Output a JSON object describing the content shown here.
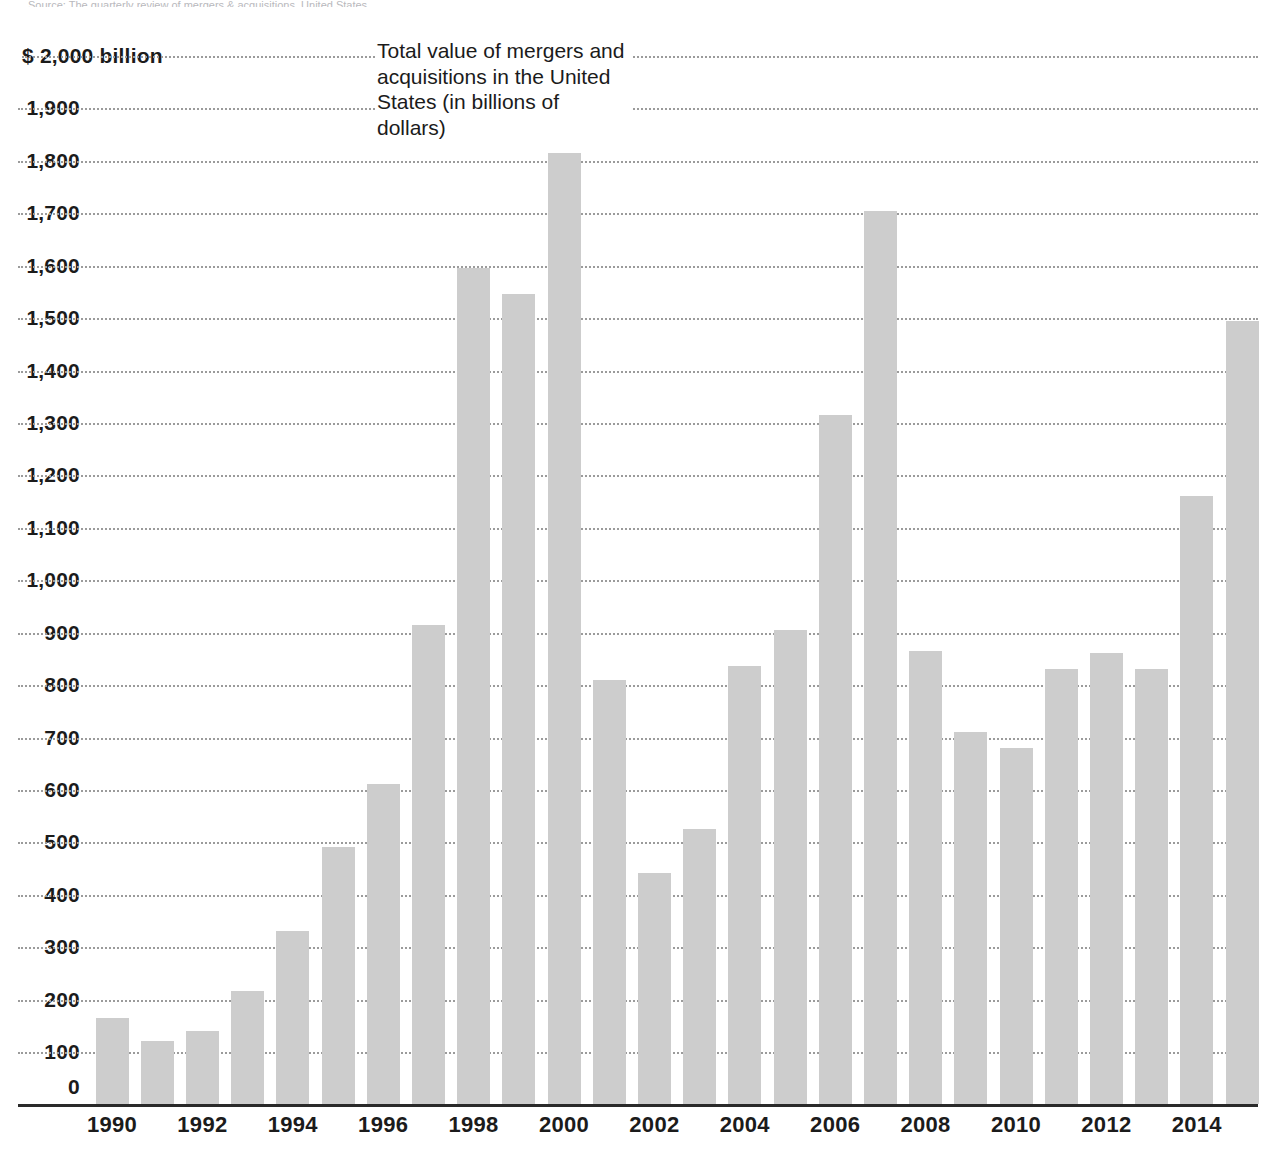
{
  "top_cutoff_text": "Source: The quarterly review of mergers & acquisitions, United States",
  "chart_title_block": "Total value of mergers and acquisitions in the United States (in billions of dollars)",
  "axis": {
    "y_top_label": "$ 2,000 billion",
    "y_tick_labels": [
      "$ 2,000 billion",
      "1,900",
      "1,800",
      "1,700",
      "1,600",
      "1,500",
      "1,400",
      "1,300",
      "1,200",
      "1,100",
      "1,000",
      "900",
      "800",
      "700",
      "600",
      "500",
      "400",
      "300",
      "200",
      "100",
      "0"
    ],
    "x_tick_labels": [
      "1990",
      "1992",
      "1994",
      "1996",
      "1998",
      "2000",
      "2002",
      "2004",
      "2006",
      "2008",
      "2010",
      "2012",
      "2014"
    ]
  },
  "colors": {
    "bar": "#cdcdcd",
    "gridline": "#9b9b9b",
    "baseline": "#2a2a2a",
    "text": "#1b1b1b",
    "background": "#ffffff"
  },
  "chart_data": {
    "type": "bar",
    "title": "Total value of mergers and acquisitions in the United States (in billions of dollars)",
    "xlabel": "",
    "ylabel": "$ billion",
    "ylim": [
      0,
      2000
    ],
    "ytick_step": 100,
    "grid": true,
    "legend": "none",
    "units": "billions of US dollars",
    "categories": [
      "1990",
      "1991",
      "1992",
      "1993",
      "1994",
      "1995",
      "1996",
      "1997",
      "1998",
      "1999",
      "2000",
      "2001",
      "2002",
      "2003",
      "2004",
      "2005",
      "2006",
      "2007",
      "2008",
      "2009",
      "2010",
      "2011",
      "2012",
      "2013",
      "2014",
      "2015"
    ],
    "values": [
      165,
      120,
      140,
      215,
      330,
      490,
      610,
      915,
      1595,
      1545,
      1815,
      810,
      440,
      525,
      835,
      905,
      1315,
      1705,
      865,
      710,
      680,
      830,
      860,
      830,
      1160,
      1495
    ]
  }
}
